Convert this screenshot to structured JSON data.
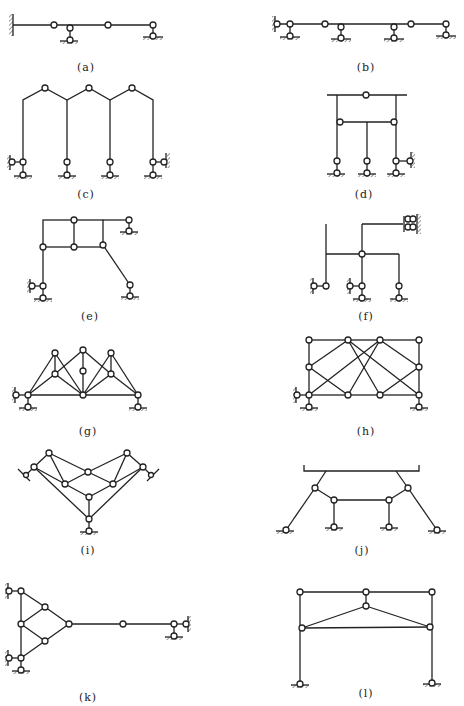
{
  "figure": {
    "panels": [
      {
        "id": "a",
        "label": "(a)",
        "description": "Continuous beam with fixed end, hinges, and link supports"
      },
      {
        "id": "b",
        "label": "(b)",
        "description": "Multi-span beam with link supports and hinges"
      },
      {
        "id": "c",
        "label": "(c)",
        "description": "Three-bay gabled frame with hinged ridges and link supports"
      },
      {
        "id": "d",
        "label": "(d)",
        "description": "Frame with hinged top beam and three columns"
      },
      {
        "id": "e",
        "label": "(e)",
        "description": "Two-cell frame with inclined strut"
      },
      {
        "id": "f",
        "label": "(f)",
        "description": "Branching frame with double-link support"
      },
      {
        "id": "g",
        "label": "(g)",
        "description": "Truss with crossing members"
      },
      {
        "id": "h",
        "label": "(h)",
        "description": "Rectangular truss with crossed diagonals"
      },
      {
        "id": "i",
        "label": "(i)",
        "description": "V-shaped truss with inclined supports"
      },
      {
        "id": "j",
        "label": "(j)",
        "description": "Hinged frame supporting a top beam"
      },
      {
        "id": "k",
        "label": "(k)",
        "description": "Triangular truss with long link bar"
      },
      {
        "id": "l",
        "label": "(l)",
        "description": "Portal frame with hinged king-post truss"
      }
    ]
  }
}
